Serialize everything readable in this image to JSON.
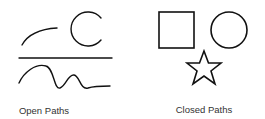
{
  "groups": [
    {
      "label": "Open Paths",
      "shapes": [
        "arc-curve",
        "open-circle",
        "straight-line",
        "wavy-line"
      ]
    },
    {
      "label": "Closed Paths",
      "shapes": [
        "square",
        "circle",
        "star"
      ]
    }
  ],
  "colors": {
    "stroke": "#111111",
    "text": "#333333",
    "background": "#ffffff"
  }
}
